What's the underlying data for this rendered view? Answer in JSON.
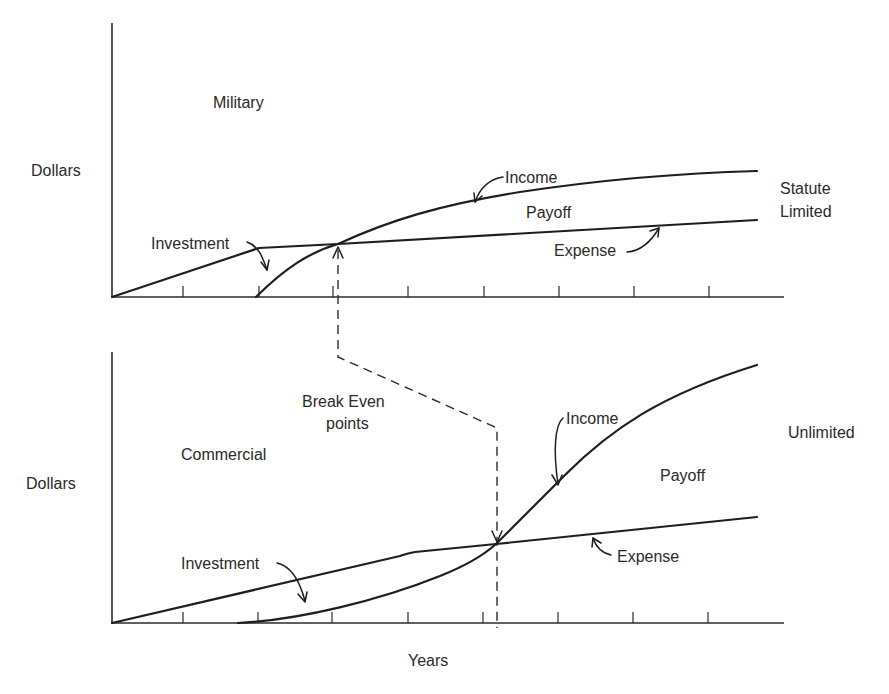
{
  "figure": {
    "x_axis_label": "Years",
    "y_axis_label": "Dollars",
    "shared_annotation": {
      "label_line1": "Break Even",
      "label_line2": "points"
    },
    "colors": {
      "ink": "#1e1e1e",
      "background": "#ffffff"
    }
  },
  "panels": [
    {
      "id": "military",
      "title": "Military",
      "y_label": "Dollars",
      "right_label_line1": "Statute",
      "right_label_line2": "Limited",
      "curve_labels": {
        "investment": "Investment",
        "income": "Income",
        "payoff": "Payoff",
        "expense": "Expense"
      },
      "x_ticks": 8
    },
    {
      "id": "commercial",
      "title": "Commercial",
      "y_label": "Dollars",
      "right_label_line1": "Unlimited",
      "curve_labels": {
        "investment": "Investment",
        "income": "Income",
        "payoff": "Payoff",
        "expense": "Expense"
      },
      "x_ticks": 8
    }
  ]
}
